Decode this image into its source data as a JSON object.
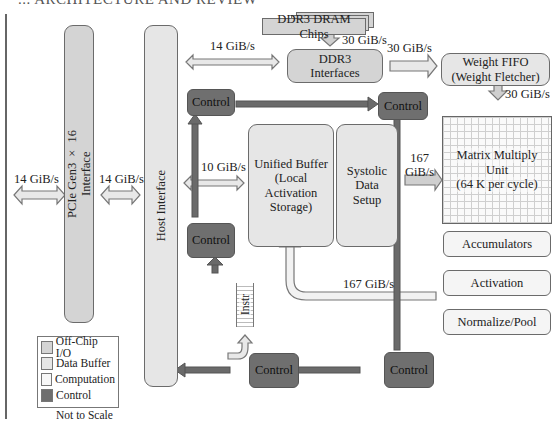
{
  "header": {
    "clipped_text": "... ARCHITECTURE AND REVIEW"
  },
  "blocks": {
    "ddr3_chips": "DDR3 DRAM Chips",
    "ddr3_interfaces": [
      "DDR3",
      "Interfaces"
    ],
    "weight_fifo": [
      "Weight FIFO",
      "(Weight Fletcher)"
    ],
    "pcie": [
      "PCIe Gen3 × 16",
      "Interface"
    ],
    "host_interface": "Host Interface",
    "unified_buffer": [
      "Unified Buffer",
      "(Local Activation",
      "Storage)"
    ],
    "systolic": [
      "Systolic",
      "Data",
      "Setup"
    ],
    "mmu": [
      "Matrix Multiply",
      "Unit",
      "(64 K per cycle)"
    ],
    "accumulators": "Accumulators",
    "activation": "Activation",
    "normalize": "Normalize/Pool",
    "instr": "Instr",
    "control": "Control"
  },
  "bandwidths": {
    "ext_pcie": "14 GiB/s",
    "pcie_host": "14 GiB/s",
    "host_ddr": "14 GiB/s",
    "chips_ddr": "30 GiB/s",
    "ddr_fifo": "30 GiB/s",
    "fifo_mmu": "30 GiB/s",
    "host_ub": "10 GiB/s",
    "systolic_mmu_1": "167",
    "systolic_mmu_2": "GiB/s",
    "pool_ub": "167 GiB/s"
  },
  "legend": {
    "items": [
      {
        "label": "Off-Chip I/O",
        "color": "#d4d4d4"
      },
      {
        "label": "Data Buffer",
        "color": "#e6e6e6"
      },
      {
        "label": "Computation",
        "color": "#f7f7f7"
      },
      {
        "label": "Control",
        "color": "#6f6f6f"
      }
    ],
    "note": "Not to Scale"
  }
}
